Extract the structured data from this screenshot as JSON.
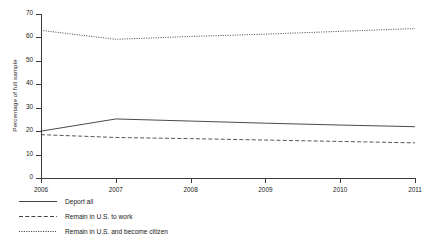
{
  "chart_data": {
    "type": "line",
    "title": "",
    "xlabel": "",
    "ylabel": "Percentage of full sample",
    "x": [
      2006,
      2007,
      2008,
      2009,
      2010,
      2011
    ],
    "xticklabels": [
      "2006",
      "2007",
      "2008",
      "2009",
      "2010",
      "2011"
    ],
    "yticklabels": [
      "0",
      "10",
      "20",
      "30",
      "40",
      "50",
      "60",
      "70"
    ],
    "yticks": [
      0,
      10,
      20,
      30,
      40,
      50,
      60,
      70
    ],
    "xlim": [
      2006,
      2011
    ],
    "ylim": [
      0,
      70
    ],
    "grid": false,
    "legend_position": "below-left",
    "series": [
      {
        "name": "Deport all",
        "style": "solid",
        "color": "#2b2b2b",
        "values": [
          20.0,
          25.2,
          24.3,
          23.4,
          22.6,
          21.9
        ]
      },
      {
        "name": "Remain in U.S. to work",
        "style": "dashed",
        "color": "#2b2b2b",
        "values": [
          18.5,
          17.3,
          16.8,
          16.2,
          15.6,
          15.0
        ]
      },
      {
        "name": "Remain in U.S. and become citizen",
        "style": "dotted",
        "color": "#2b2b2b",
        "values": [
          63.0,
          59.2,
          60.4,
          61.4,
          62.6,
          63.8
        ]
      }
    ]
  },
  "axis": {
    "y_title": "Percentage of full sample"
  }
}
